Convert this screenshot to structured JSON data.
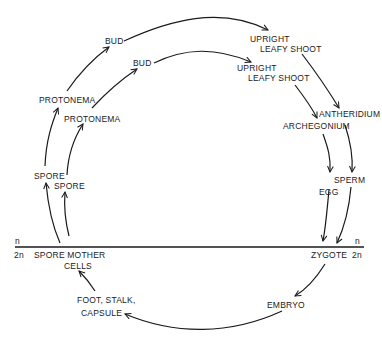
{
  "diagram": {
    "type": "life-cycle",
    "outer_cycle": {
      "stages": [
        "SPORE",
        "PROTONEMA",
        "BUD",
        "UPRIGHT LEAFY SHOOT",
        "ANTHERIDIUM",
        "SPERM"
      ]
    },
    "inner_cycle": {
      "stages": [
        "SPORE",
        "PROTONEMA",
        "BUD",
        "UPRIGHT LEAFY SHOOT",
        "ARCHEGONIUM",
        "EGG"
      ]
    },
    "diploid_phase": {
      "stages": [
        "ZYGOTE",
        "EMBRYO",
        "FOOT, STALK, CAPSULE",
        "SPORE MOTHER CELLS"
      ]
    },
    "labels": {
      "n_left": "n",
      "two_n_left": "2n",
      "n_right": "n",
      "two_n_right": "2n",
      "spore_outer": "SPORE",
      "spore_inner": "SPORE",
      "protonema_outer": "PROTONEMA",
      "protonema_inner": "PROTONEMA",
      "bud_outer": "BUD",
      "bud_inner": "BUD",
      "upright_outer_1": "UPRIGHT",
      "upright_outer_2": "LEAFY SHOOT",
      "upright_inner_1": "UPRIGHT",
      "upright_inner_2": "LEAFY SHOOT",
      "antheridium": "ANTHERIDIUM",
      "archegonium": "ARCHEGONIUM",
      "sperm": "SPERM",
      "egg": "EGG",
      "zygote": "ZYGOTE",
      "embryo": "EMBRYO",
      "foot_stalk": "FOOT, STALK,",
      "capsule": "CAPSULE",
      "spore_mother": "SPORE MOTHER",
      "cells": "CELLS"
    },
    "colors": {
      "ink": "#1a1a1a",
      "background": "#ffffff"
    }
  }
}
